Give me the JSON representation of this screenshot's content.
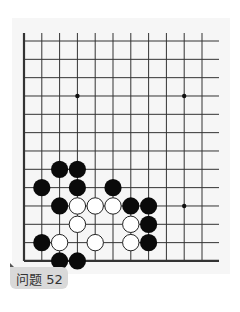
{
  "problem": {
    "label": "问题 52"
  },
  "board": {
    "columns": 11,
    "rows": 13,
    "origin_x": 24,
    "origin_y": 41,
    "spacing_x": 17.8,
    "spacing_y": 18.33,
    "right_extent": 219,
    "edges": [
      "left",
      "bottom"
    ],
    "line_color": "#333333",
    "star_points": [
      [
        3,
        3
      ],
      [
        9,
        3
      ],
      [
        9,
        9
      ]
    ],
    "stones": {
      "black": [
        [
          2,
          7
        ],
        [
          3,
          7
        ],
        [
          1,
          8
        ],
        [
          3,
          8
        ],
        [
          5,
          8
        ],
        [
          2,
          9
        ],
        [
          6,
          9
        ],
        [
          7,
          9
        ],
        [
          7,
          10
        ],
        [
          1,
          11
        ],
        [
          7,
          11
        ],
        [
          2,
          12
        ],
        [
          3,
          12
        ]
      ],
      "white": [
        [
          3,
          9
        ],
        [
          4,
          9
        ],
        [
          5,
          9
        ],
        [
          3,
          10
        ],
        [
          6,
          10
        ],
        [
          2,
          11
        ],
        [
          4,
          11
        ],
        [
          6,
          11
        ]
      ]
    }
  }
}
